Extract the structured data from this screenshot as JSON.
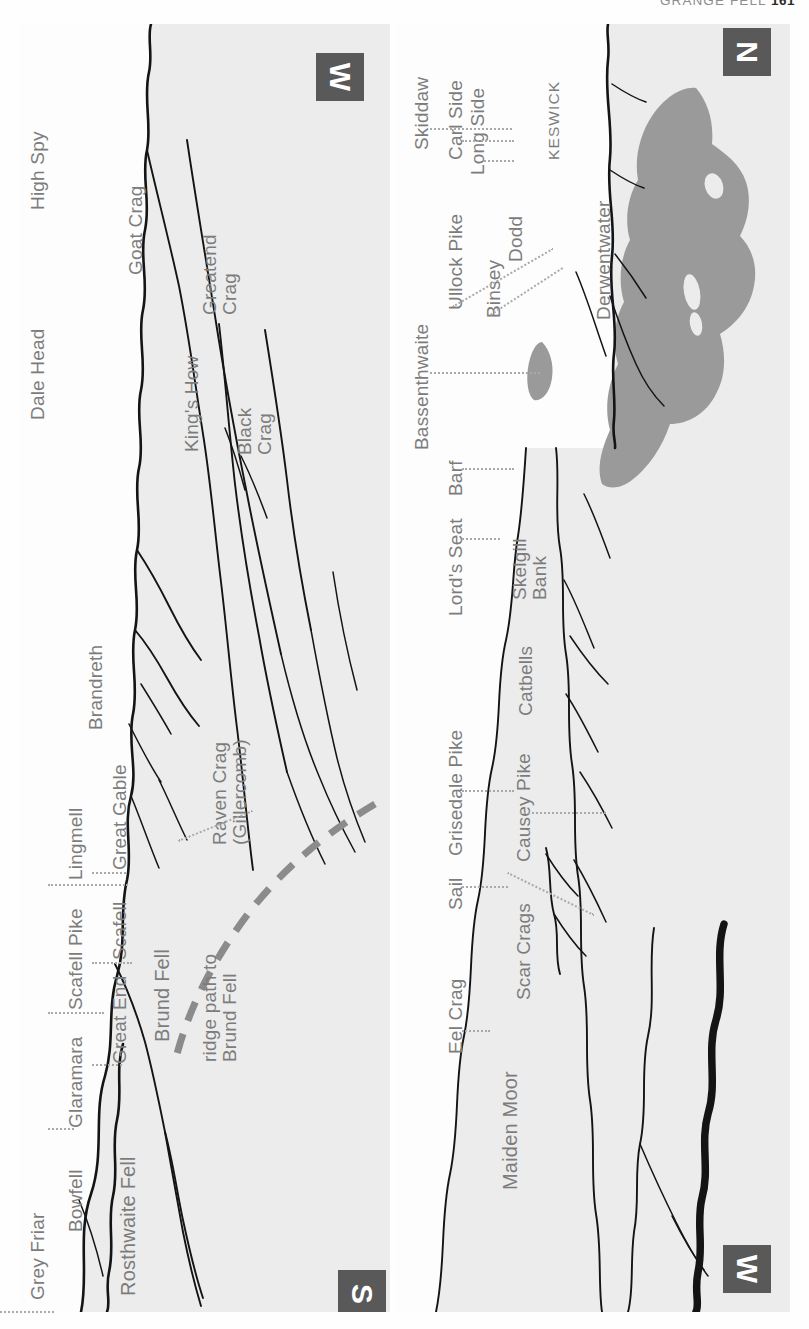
{
  "running_head": {
    "title": "GRANGE FELL",
    "page_number": "161"
  },
  "colors": {
    "panel_background": "#ececec",
    "sky_background": "#fdfdfd",
    "skyline_ink": "#141414",
    "label_text": "#7c7c7c",
    "leader_line": "#a9a9a9",
    "compass_block": "#595959",
    "compass_text": "#ffffff",
    "lake_fill": "#9a9a9a",
    "ridge_path": "#8b8b8b"
  },
  "panels": [
    {
      "id": "left",
      "name": "upper-panorama",
      "compass_start": "W",
      "compass_end": "S",
      "labels": [
        {
          "text": "High Spy",
          "kind": "summit"
        },
        {
          "text": "Dale Head",
          "kind": "summit"
        },
        {
          "text": "Goat Crag",
          "kind": "feature"
        },
        {
          "text": "King's How",
          "kind": "feature"
        },
        {
          "text": "Greatend Crag",
          "kind": "feature",
          "lines": [
            "Greatend",
            "Crag"
          ]
        },
        {
          "text": "Black Crag",
          "kind": "feature",
          "lines": [
            "Black",
            "Crag"
          ]
        },
        {
          "text": "Brandreth",
          "kind": "summit"
        },
        {
          "text": "Great Gable",
          "kind": "summit"
        },
        {
          "text": "Lingmell",
          "kind": "summit"
        },
        {
          "text": "Scafell",
          "kind": "summit"
        },
        {
          "text": "Scafell Pike",
          "kind": "summit"
        },
        {
          "text": "Great End",
          "kind": "summit"
        },
        {
          "text": "Glaramara",
          "kind": "summit"
        },
        {
          "text": "Bowfell",
          "kind": "summit"
        },
        {
          "text": "Grey Friar",
          "kind": "summit"
        },
        {
          "text": "Raven Crag (Gillercomb)",
          "kind": "feature",
          "lines": [
            "Raven Crag",
            "(Gillercomb)"
          ]
        },
        {
          "text": "Brund Fell",
          "kind": "feature"
        },
        {
          "text": "Rosthwaite Fell",
          "kind": "feature"
        }
      ],
      "annotation": {
        "italic_part": "ridge path to",
        "plain_part": "Brund Fell"
      }
    },
    {
      "id": "right",
      "name": "lower-panorama",
      "compass_start": "N",
      "compass_end": "W",
      "labels": [
        {
          "text": "Skiddaw",
          "kind": "summit"
        },
        {
          "text": "Carl Side",
          "kind": "summit"
        },
        {
          "text": "Long Side",
          "kind": "summit"
        },
        {
          "text": "Ullock Pike",
          "kind": "summit"
        },
        {
          "text": "Binsey",
          "kind": "summit"
        },
        {
          "text": "Dodd",
          "kind": "summit"
        },
        {
          "text": "KESWICK",
          "kind": "town"
        },
        {
          "text": "Derwentwater",
          "kind": "water"
        },
        {
          "text": "Bassenthwaite",
          "kind": "water"
        },
        {
          "text": "Barf",
          "kind": "summit"
        },
        {
          "text": "Lord's Seat",
          "kind": "summit"
        },
        {
          "text": "Skelgill Bank",
          "kind": "feature",
          "lines": [
            "Skelgill",
            "Bank"
          ]
        },
        {
          "text": "Catbells",
          "kind": "summit"
        },
        {
          "text": "Grisedale Pike",
          "kind": "summit"
        },
        {
          "text": "Causey Pike",
          "kind": "summit"
        },
        {
          "text": "Sail",
          "kind": "summit"
        },
        {
          "text": "Scar Crags",
          "kind": "summit"
        },
        {
          "text": "Eel Crag",
          "kind": "summit"
        },
        {
          "text": "Maiden Moor",
          "kind": "feature"
        }
      ]
    }
  ]
}
